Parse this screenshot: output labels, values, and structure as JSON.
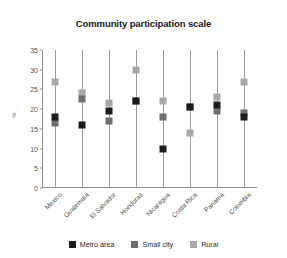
{
  "chart_data": {
    "type": "scatter",
    "title": "Community participation scale",
    "xlabel": "",
    "ylabel": "%",
    "ylim": [
      0,
      35
    ],
    "yticks": [
      0,
      5,
      10,
      15,
      20,
      25,
      30,
      35
    ],
    "grid": false,
    "legend_position": "bottom",
    "categories": [
      "Mexico",
      "Guatemala",
      "El Salvador",
      "Honduras",
      "Nicaragua",
      "Costa Rica",
      "Panama",
      "Colombia"
    ],
    "series": [
      {
        "name": "Metro area",
        "color": "#1c1c1c",
        "values": [
          18,
          16,
          19.5,
          22,
          10,
          20.5,
          21,
          18
        ]
      },
      {
        "name": "Small city",
        "color": "#6e6e6e",
        "values": [
          16.5,
          22.5,
          17,
          22,
          18,
          20.5,
          19.5,
          19
        ]
      },
      {
        "name": "Rural",
        "color": "#a8a8a8",
        "values": [
          27,
          24,
          21.5,
          30,
          22,
          14,
          23,
          27
        ]
      }
    ]
  },
  "legend": {
    "items": [
      {
        "label": "Metro area",
        "color": "#1c1c1c"
      },
      {
        "label": "Small city",
        "color": "#6e6e6e"
      },
      {
        "label": "Rural",
        "color": "#a8a8a8"
      }
    ]
  }
}
